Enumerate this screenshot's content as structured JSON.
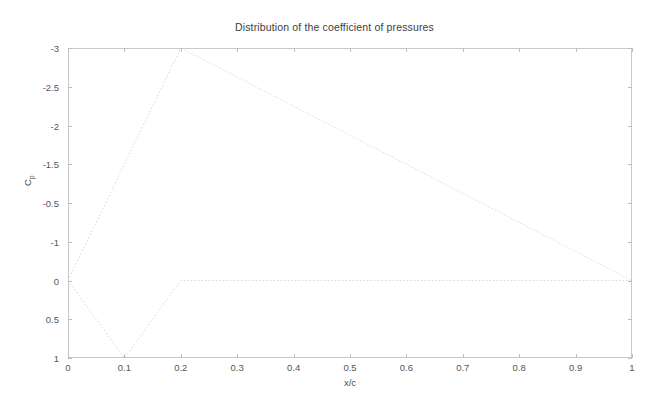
{
  "figure": {
    "title": "Distribution of the coefficient of pressures",
    "background_color": "#ffffff",
    "axis_color": "#c9c9c9",
    "text_color": "#4a4a4a"
  },
  "axes": {
    "xlabel": "x/c",
    "ylabel_main": "C",
    "ylabel_sub": "p",
    "x_ticklabels": [
      "0",
      "0.1",
      "0.2",
      "0.3",
      "0.4",
      "0.5",
      "0.6",
      "0.7",
      "0.8",
      "0.9",
      "1"
    ],
    "y_ticklabels": [
      "-3",
      "-2.5",
      "-2",
      "-1.5",
      "-0.5",
      "-1",
      "0",
      "0.5",
      "1"
    ]
  },
  "chart_data": {
    "type": "line",
    "title": "Distribution of the coefficient of pressures",
    "xlabel": "x/c",
    "ylabel": "Cp",
    "xlim": [
      0,
      1
    ],
    "ylim": [
      1,
      -3
    ],
    "y_inverted": true,
    "grid": false,
    "legend": null,
    "xticks": [
      0,
      0.1,
      0.2,
      0.3,
      0.4,
      0.5,
      0.6,
      0.7,
      0.8,
      0.9,
      1
    ],
    "xticklabels": [
      "0",
      "0.1",
      "0.2",
      "0.3",
      "0.4",
      "0.5",
      "0.6",
      "0.7",
      "0.8",
      "0.9",
      "1"
    ],
    "yticks": [
      -3,
      -2.5,
      -2,
      -1.5,
      -1,
      -0.5,
      0,
      0.5,
      1
    ],
    "yticklabels": [
      "-3",
      "-2.5",
      "-2",
      "-1.5",
      "-0.5",
      "-1",
      "0",
      "0.5",
      "1"
    ],
    "series": [
      {
        "name": "upper-surface",
        "linestyle": "dotted",
        "color": "#d6d6d6",
        "linewidth": 1,
        "x": [
          0,
          0.2,
          1
        ],
        "y": [
          0,
          -3,
          0
        ]
      },
      {
        "name": "lower-surface",
        "linestyle": "dotted",
        "color": "#d6d6d6",
        "linewidth": 1,
        "x": [
          0,
          0.1,
          0.2,
          1
        ],
        "y": [
          0,
          1,
          0,
          0
        ]
      }
    ]
  }
}
